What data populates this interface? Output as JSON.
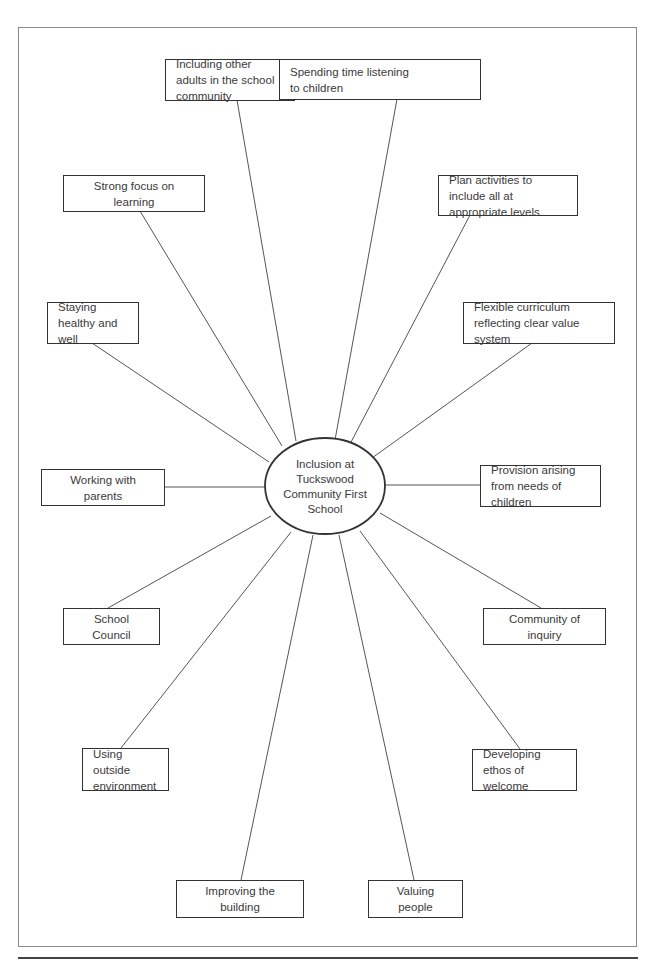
{
  "diagram": {
    "type": "spider-diagram",
    "center": {
      "label": "Inclusion at Tuckswood Community First School",
      "lines": [
        "Inclusion",
        "at Tuckswood",
        "Community First",
        "School"
      ]
    },
    "nodes": [
      {
        "id": "including-adults",
        "label": "Including other adults in the school community"
      },
      {
        "id": "listening",
        "label": "Spending time listening to children"
      },
      {
        "id": "focus-learning",
        "label": "Strong focus on learning"
      },
      {
        "id": "plan-activities",
        "label": "Plan activities to include all at appropriate levels"
      },
      {
        "id": "healthy",
        "label": "Staying healthy and well"
      },
      {
        "id": "flexible-curriculum",
        "label": "Flexible curriculum reflecting clear value system"
      },
      {
        "id": "parents",
        "label": "Working with parents"
      },
      {
        "id": "provision",
        "label": "Provision arising from needs of children"
      },
      {
        "id": "school-council",
        "label": "School Council"
      },
      {
        "id": "inquiry",
        "label": "Community of inquiry"
      },
      {
        "id": "outside",
        "label": "Using outside environment"
      },
      {
        "id": "ethos",
        "label": "Developing ethos of welcome"
      },
      {
        "id": "building",
        "label": "Improving the building"
      },
      {
        "id": "valuing",
        "label": "Valuing people"
      }
    ],
    "colors": {
      "line": "#555555",
      "border": "#333333",
      "text": "#3a3a3a"
    }
  }
}
